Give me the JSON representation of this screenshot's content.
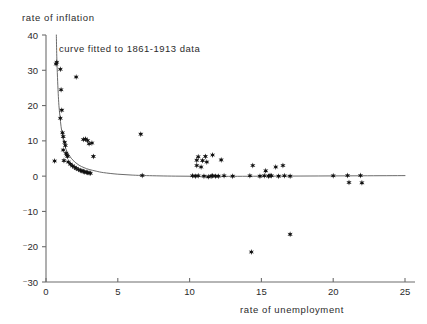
{
  "chart_data": {
    "type": "scatter",
    "title": "",
    "xlabel": "rate of unemployment",
    "ylabel": "rate of inflation",
    "xlim": [
      0,
      25
    ],
    "ylim": [
      -30,
      40
    ],
    "xticks": [
      0,
      5,
      10,
      15,
      20,
      25
    ],
    "yticks": [
      -30,
      -20,
      -10,
      0,
      10,
      20,
      30,
      40
    ],
    "xtick_labels": [
      "0",
      "5",
      "10",
      "15",
      "20",
      "25"
    ],
    "ytick_labels": [
      "⁻30",
      "⁻20",
      "⁻10",
      "0",
      "10",
      "20",
      "30",
      "40"
    ],
    "grid": false,
    "legend": "none",
    "annotations": [
      {
        "text": "curve fitted to 1861-1913 data",
        "x": 1.1,
        "y": 37.0
      }
    ],
    "marker": "star",
    "marker_color": "#111111",
    "curve_color": "#5a5a5a",
    "series": [
      {
        "name": "observations",
        "points": [
          [
            0.6,
            4.3
          ],
          [
            0.7,
            31.8
          ],
          [
            0.75,
            32.3
          ],
          [
            1.0,
            30.3
          ],
          [
            1.05,
            24.5
          ],
          [
            1.1,
            18.7
          ],
          [
            1.0,
            16.4
          ],
          [
            1.15,
            12.3
          ],
          [
            1.2,
            11.2
          ],
          [
            1.3,
            9.6
          ],
          [
            1.35,
            8.7
          ],
          [
            1.2,
            7.4
          ],
          [
            1.4,
            6.5
          ],
          [
            1.45,
            6.0
          ],
          [
            1.5,
            5.6
          ],
          [
            1.25,
            4.4
          ],
          [
            1.55,
            4.0
          ],
          [
            1.7,
            3.4
          ],
          [
            1.85,
            2.9
          ],
          [
            2.0,
            2.5
          ],
          [
            2.1,
            2.2
          ],
          [
            2.25,
            1.9
          ],
          [
            2.4,
            1.6
          ],
          [
            2.5,
            1.5
          ],
          [
            2.6,
            1.3
          ],
          [
            2.7,
            1.2
          ],
          [
            2.8,
            1.1
          ],
          [
            2.9,
            1.0
          ],
          [
            3.0,
            0.9
          ],
          [
            3.1,
            0.8
          ],
          [
            2.1,
            28.1
          ],
          [
            2.6,
            10.4
          ],
          [
            2.75,
            10.5
          ],
          [
            2.9,
            10.1
          ],
          [
            3.0,
            9.2
          ],
          [
            3.2,
            9.4
          ],
          [
            3.3,
            5.6
          ],
          [
            6.6,
            11.9
          ],
          [
            6.7,
            0.2
          ],
          [
            10.2,
            0.1
          ],
          [
            10.4,
            0.0
          ],
          [
            10.6,
            0.1
          ],
          [
            10.5,
            3.0
          ],
          [
            10.5,
            4.5
          ],
          [
            10.6,
            5.5
          ],
          [
            10.8,
            2.6
          ],
          [
            10.9,
            4.4
          ],
          [
            11.0,
            0.0
          ],
          [
            11.1,
            5.6
          ],
          [
            11.2,
            4.0
          ],
          [
            11.3,
            -0.2
          ],
          [
            11.5,
            0.0
          ],
          [
            11.6,
            0.1
          ],
          [
            11.8,
            0.0
          ],
          [
            11.6,
            6.0
          ],
          [
            12.0,
            0.0
          ],
          [
            12.2,
            4.6
          ],
          [
            12.4,
            0.1
          ],
          [
            13.0,
            0.0
          ],
          [
            14.2,
            0.1
          ],
          [
            14.4,
            3.0
          ],
          [
            14.9,
            0.0
          ],
          [
            15.2,
            0.1
          ],
          [
            15.3,
            1.5
          ],
          [
            15.5,
            0.0
          ],
          [
            15.6,
            0.2
          ],
          [
            15.7,
            0.1
          ],
          [
            16.0,
            2.6
          ],
          [
            16.2,
            0.0
          ],
          [
            16.5,
            3.0
          ],
          [
            16.6,
            0.1
          ],
          [
            17.0,
            0.0
          ],
          [
            14.3,
            -21.5
          ],
          [
            17.0,
            -16.5
          ],
          [
            20.0,
            0.1
          ],
          [
            21.0,
            0.2
          ],
          [
            21.1,
            -1.8
          ],
          [
            21.9,
            0.2
          ],
          [
            22.0,
            -1.9
          ]
        ]
      }
    ],
    "fitted_curve": {
      "name": "curve fitted to 1861-1913 data",
      "points": [
        [
          0.72,
          40.0
        ],
        [
          0.75,
          34.0
        ],
        [
          0.8,
          28.0
        ],
        [
          0.85,
          23.5
        ],
        [
          0.9,
          20.0
        ],
        [
          0.97,
          17.0
        ],
        [
          1.05,
          14.0
        ],
        [
          1.15,
          11.5
        ],
        [
          1.25,
          9.6
        ],
        [
          1.4,
          7.6
        ],
        [
          1.55,
          6.3
        ],
        [
          1.75,
          5.1
        ],
        [
          2.0,
          4.0
        ],
        [
          2.3,
          3.1
        ],
        [
          2.65,
          2.4
        ],
        [
          3.0,
          1.9
        ],
        [
          3.5,
          1.4
        ],
        [
          4.0,
          1.0
        ],
        [
          5.0,
          0.55
        ],
        [
          6.0,
          0.3
        ],
        [
          7.0,
          0.15
        ],
        [
          9.0,
          0.0
        ],
        [
          11.0,
          -0.05
        ],
        [
          13.0,
          -0.05
        ],
        [
          16.0,
          0.0
        ],
        [
          19.0,
          0.05
        ],
        [
          22.0,
          0.1
        ],
        [
          25.0,
          0.15
        ]
      ]
    }
  }
}
